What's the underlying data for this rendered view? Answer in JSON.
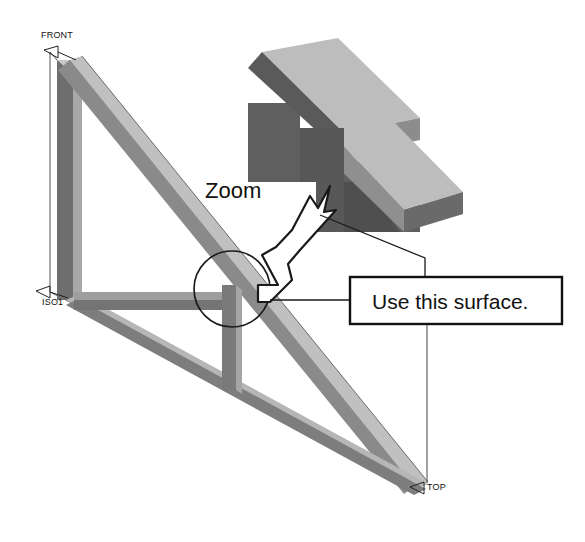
{
  "figure": {
    "background_color": "#ffffff",
    "width": 585,
    "height": 542
  },
  "view_labels": {
    "front": "FRONT",
    "iso": "ISO1",
    "top": "TOP"
  },
  "annotations": {
    "zoom_label": "Zoom",
    "callout_text": "Use this surface."
  },
  "colors": {
    "line": "#111111",
    "thin_line": "#333333",
    "beam_light": "#c9c9c9",
    "beam_mid": "#a8a8a8",
    "beam_dark": "#6e6e6e",
    "beam_darkest": "#4a4a4a",
    "inset_top_face": "#bdbdbd",
    "inset_side_face": "#5f5f5f",
    "inset_edge_face": "#8c8c8c",
    "white": "#ffffff"
  },
  "geometry": {
    "detail_circle": {
      "cx": 232,
      "cy": 289,
      "r": 38
    },
    "callout_box": {
      "x": 350,
      "y": 277,
      "width": 212,
      "height": 47
    },
    "inset_region": {
      "x": 248,
      "y": 38,
      "width": 215,
      "height": 190
    }
  }
}
